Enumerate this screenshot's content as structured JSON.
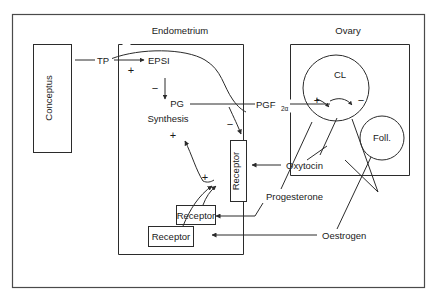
{
  "diagram": {
    "title_compartments": {
      "endometrium": "Endometrium",
      "ovary": "Ovary"
    },
    "nodes": {
      "conceptus": "Conceptus",
      "tp": "TP",
      "epsi": "EPSI",
      "pg_synthesis_line1": "PG",
      "pg_synthesis_line2": "Synthesis",
      "pgf2a_main": "PGF",
      "pgf2a_sub": "2α",
      "cl": "CL",
      "foll": "Foll.",
      "receptor_vertical": "Receptor",
      "receptor_mid": "Receptor",
      "receptor_lower": "Receptor",
      "oxytocin": "Oxytocin",
      "progesterone": "Progesterone",
      "oestrogen": "Oestrogen"
    },
    "signs": {
      "tp_to_epsi_plus": "+",
      "epsi_to_pg_minus": "−",
      "pg_synthesis_plus": "+",
      "pg_to_receptor_minus": "−",
      "cl_plus": "+",
      "cl_minus": "−",
      "receptor_plus": "+"
    },
    "colors": {
      "ink": "#2b2b2b",
      "frame": "#4a4a4a",
      "background": "#ffffff"
    }
  }
}
